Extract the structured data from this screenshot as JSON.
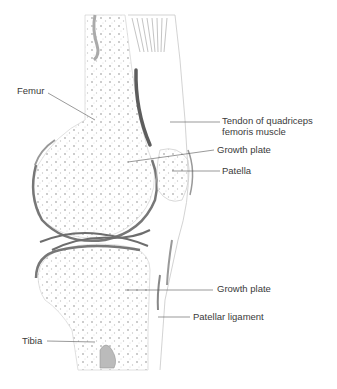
{
  "diagram": {
    "labels": [
      {
        "id": "femur",
        "text": "Femur",
        "x": 17,
        "y": 85
      },
      {
        "id": "tendon",
        "lines": [
          "Tendon of quadriceps",
          "femoris muscle"
        ],
        "x": 222,
        "y": 115
      },
      {
        "id": "growth-plate-upper",
        "text": "Growth plate",
        "x": 217,
        "y": 144
      },
      {
        "id": "patella",
        "text": "Patella",
        "x": 222,
        "y": 165
      },
      {
        "id": "growth-plate-lower",
        "text": "Growth plate",
        "x": 217,
        "y": 283
      },
      {
        "id": "patellar-ligament",
        "text": "Patellar ligament",
        "x": 193,
        "y": 311
      },
      {
        "id": "tibia",
        "text": "Tibia",
        "x": 22,
        "y": 335
      }
    ],
    "colors": {
      "line": "#555555",
      "bone_outline": "#cfcfcf",
      "cartilage": "#6d6d6d",
      "text": "#3a3a3a"
    }
  }
}
